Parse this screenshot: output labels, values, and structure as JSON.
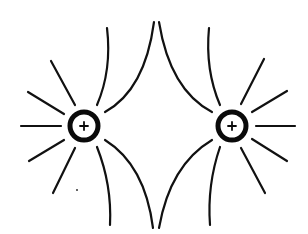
{
  "diagram": {
    "background": "#ffffff",
    "ink_color": "#111111",
    "charges": [
      {
        "id": "left",
        "sign": "+",
        "cx": 84,
        "cy": 126,
        "r": 15
      },
      {
        "id": "right",
        "sign": "+",
        "cx": 232,
        "cy": 126,
        "r": 15
      }
    ],
    "left_charge_label": "+",
    "right_charge_label": "+",
    "field_lines": {
      "left_radial_count": 5,
      "right_radial_count": 5,
      "curved_between_count": 8
    }
  }
}
